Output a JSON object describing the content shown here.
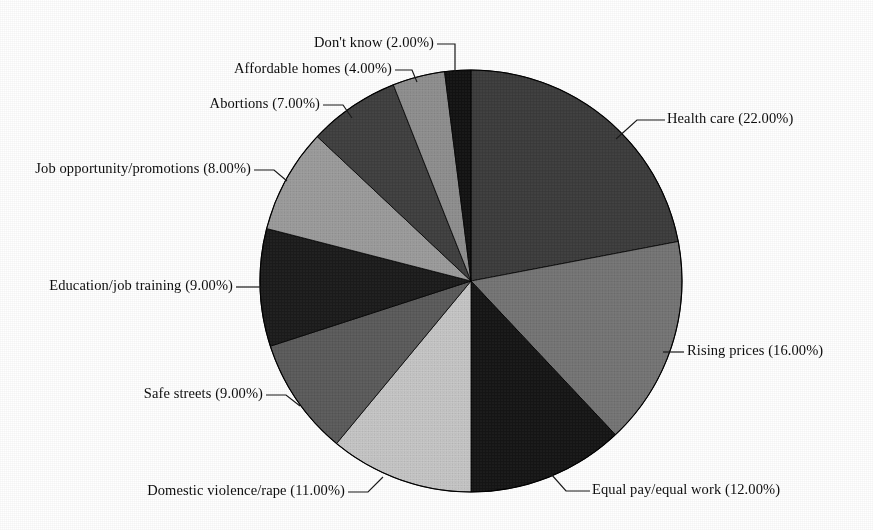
{
  "chart_data": {
    "type": "pie",
    "title": "",
    "subtitle": "",
    "xlabel": "",
    "ylabel": "",
    "legend_position": "none",
    "grid": false,
    "label_format": "name (value%)",
    "start_angle_deg": 0,
    "direction": "clockwise",
    "total": 100,
    "categories": [
      "Health care",
      "Rising prices",
      "Equal pay/equal work",
      "Domestic violence/rape",
      "Safe streets",
      "Education/job training",
      "Job opportunity/promotions",
      "Abortions",
      "Affordable homes",
      "Don't know"
    ],
    "values": [
      22,
      16,
      12,
      11,
      9,
      9,
      8,
      7,
      4,
      2
    ],
    "value_labels": [
      "22.00%",
      "16.00%",
      "12.00%",
      "11.00%",
      "9.00%",
      "9.00%",
      "8.00%",
      "7.00%",
      "4.00%",
      "2.00%"
    ],
    "colors": [
      "#3c3c3c",
      "#757575",
      "#151515",
      "#c6c6c6",
      "#5b5b5b",
      "#1b1b1b",
      "#9c9c9c",
      "#3f3f3f",
      "#8f8f8f",
      "#121212"
    ],
    "slices": [
      {
        "name": "Health care",
        "value": 22,
        "value_label": "22.00%",
        "label": "Health care (22.00%)",
        "color": "#3c3c3c",
        "start_deg": 0,
        "end_deg": 79.2
      },
      {
        "name": "Rising prices",
        "value": 16,
        "value_label": "16.00%",
        "label": "Rising prices (16.00%)",
        "color": "#757575",
        "start_deg": 79.2,
        "end_deg": 136.8
      },
      {
        "name": "Equal pay/equal work",
        "value": 12,
        "value_label": "12.00%",
        "label": "Equal pay/equal work (12.00%)",
        "color": "#151515",
        "start_deg": 136.8,
        "end_deg": 180.0
      },
      {
        "name": "Domestic violence/rape",
        "value": 11,
        "value_label": "11.00%",
        "label": "Domestic violence/rape (11.00%)",
        "color": "#c6c6c6",
        "start_deg": 180.0,
        "end_deg": 219.6
      },
      {
        "name": "Safe streets",
        "value": 9,
        "value_label": "9.00%",
        "label": "Safe streets (9.00%)",
        "color": "#5b5b5b",
        "start_deg": 219.6,
        "end_deg": 252.0
      },
      {
        "name": "Education/job training",
        "value": 9,
        "value_label": "9.00%",
        "label": "Education/job training (9.00%)",
        "color": "#1b1b1b",
        "start_deg": 252.0,
        "end_deg": 284.4
      },
      {
        "name": "Job opportunity/promotions",
        "value": 8,
        "value_label": "8.00%",
        "label": "Job opportunity/promotions (8.00%)",
        "color": "#9c9c9c",
        "start_deg": 284.4,
        "end_deg": 313.2
      },
      {
        "name": "Abortions",
        "value": 7,
        "value_label": "7.00%",
        "label": "Abortions (7.00%)",
        "color": "#3f3f3f",
        "start_deg": 313.2,
        "end_deg": 338.4
      },
      {
        "name": "Affordable homes",
        "value": 4,
        "value_label": "4.00%",
        "label": "Affordable homes (4.00%)",
        "color": "#8f8f8f",
        "start_deg": 338.4,
        "end_deg": 352.8
      },
      {
        "name": "Don't know",
        "value": 2,
        "value_label": "2.00%",
        "label": "Don't know (2.00%)",
        "color": "#121212",
        "start_deg": 352.8,
        "end_deg": 360.0
      }
    ]
  },
  "labels": {
    "health_care": "Health care (22.00%)",
    "rising_prices": "Rising prices (16.00%)",
    "equal_pay": "Equal pay/equal work (12.00%)",
    "domestic_violence": "Domestic violence/rape (11.00%)",
    "safe_streets": "Safe streets (9.00%)",
    "education": "Education/job training (9.00%)",
    "job_opportunity": "Job opportunity/promotions (8.00%)",
    "abortions": "Abortions (7.00%)",
    "affordable_homes": "Affordable homes (4.00%)",
    "dont_know": "Don't know (2.00%)"
  },
  "figure": {
    "background": "#ffffff",
    "outline_color": "#000000",
    "leader_line_color": "#1a1a1a",
    "center_x": 471,
    "center_y": 281,
    "radius": 211
  }
}
